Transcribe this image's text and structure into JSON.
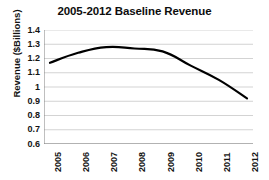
{
  "chart_data": {
    "type": "line",
    "title": "2005-2012 Baseline Revenue",
    "xlabel": "",
    "ylabel": "Revenue ($Billions)",
    "categories": [
      "2005",
      "2006",
      "2007",
      "2008",
      "2009",
      "2010",
      "2011",
      "2012"
    ],
    "values": [
      1.17,
      1.24,
      1.28,
      1.27,
      1.25,
      1.15,
      1.05,
      0.92
    ],
    "series": [
      {
        "name": "Baseline Revenue",
        "values": [
          1.17,
          1.24,
          1.28,
          1.27,
          1.25,
          1.15,
          1.05,
          0.92
        ],
        "color": "#000000"
      }
    ],
    "ylim": [
      0.6,
      1.4
    ],
    "ytick_labels": [
      "1.4",
      "1.3",
      "1.2",
      "1.1",
      "1",
      "0.9",
      "0.8",
      "0.7",
      "0.6"
    ],
    "ytick_values": [
      1.4,
      1.3,
      1.2,
      1.1,
      1.0,
      0.9,
      0.8,
      0.7,
      0.6
    ],
    "grid": true,
    "grid_color": "#c8c8c8",
    "legend": "none",
    "line_width": 2.2,
    "axis_color": "#808080",
    "background_color": "#ffffff"
  }
}
